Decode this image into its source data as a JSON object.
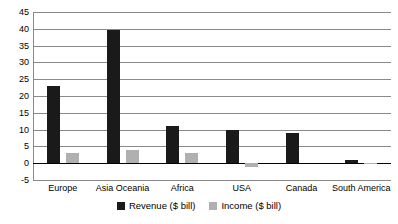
{
  "chart_data": {
    "type": "bar",
    "title": "",
    "subtitle": "",
    "xlabel": "",
    "ylabel": "",
    "ylim": [
      -5,
      45
    ],
    "ytick_step": 5,
    "yticks": [
      45,
      40,
      35,
      30,
      25,
      20,
      15,
      10,
      5,
      0,
      -5
    ],
    "ytick_labels": [
      "45",
      "40",
      "35",
      "30",
      "25",
      "20",
      "15",
      "10",
      "5",
      "0",
      "-5"
    ],
    "grid": true,
    "legend_position": "bottom",
    "categories": [
      "Europe",
      "Asia Oceania",
      "Africa",
      "USA",
      "Canada",
      "South America"
    ],
    "series": [
      {
        "name": "Revenue ($ bill)",
        "color": "#1a1a1a",
        "values": [
          23,
          39.5,
          11,
          10,
          9,
          1
        ]
      },
      {
        "name": "Income ($ bill)",
        "color": "#b0b0b0",
        "values": [
          3,
          4,
          3,
          -1,
          0,
          0.2
        ]
      }
    ]
  }
}
